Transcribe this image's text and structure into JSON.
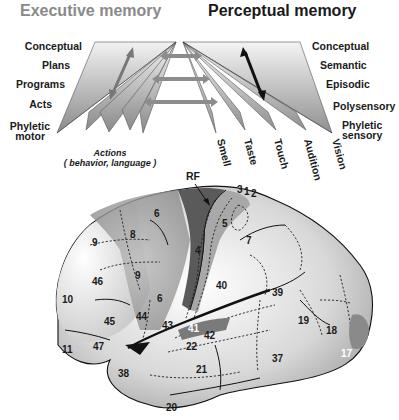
{
  "figure": {
    "executive_title": "Executive memory",
    "perceptual_title": "Perceptual memory",
    "executive_levels": [
      "Conceptual",
      "Plans",
      "Programs",
      "Acts",
      "Phyletic",
      "motor"
    ],
    "perceptual_levels": [
      "Conceptual",
      "Semantic",
      "Episodic",
      "Polysensory",
      "Phyletic",
      "sensory"
    ],
    "actions_label": "Actions",
    "actions_sub": "( behavior, language )",
    "senses": [
      "Smell",
      "Taste",
      "Touch",
      "Audition",
      "Vision"
    ],
    "rf_label": "RF",
    "areas": {
      "a3": "3",
      "a1": "1",
      "a2": "2",
      "a4": "4",
      "a5": "5",
      "a6a": "6",
      "a6b": "6",
      "a7": "7",
      "a8": "8",
      "a9a": "9",
      "a9b": "9",
      "a10": "10",
      "a11": "11",
      "a17": "17",
      "a18": "18",
      "a19": "19",
      "a20": "20",
      "a21": "21",
      "a22": "22",
      "a37": "37",
      "a38": "38",
      "a39": "39",
      "a40": "40",
      "a41": "41",
      "a42": "42",
      "a43": "43",
      "a44": "44",
      "a45": "45",
      "a46": "46",
      "a47": "47"
    },
    "colors": {
      "executive_title": "#8a8a8a",
      "perceptual_title": "#1a1a1a",
      "frontal_dark": "#6e6e6e",
      "motor_strip": "#5a5a5a",
      "arrow_gray": "#8c8c8c",
      "arrow_black": "#111111"
    }
  }
}
